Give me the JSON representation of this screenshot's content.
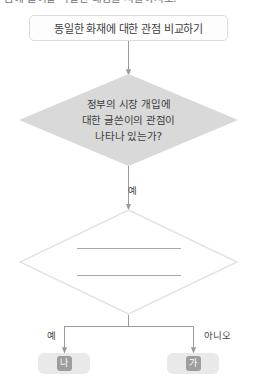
{
  "page": {
    "clipped_heading": "음에 들어갈 적절한 내용을 서술하시오.",
    "background_color": "#ffffff",
    "line_color": "#9a9a9a",
    "diamond_fill": "#d9d9d9",
    "pill_fill": "#e9e9e9",
    "chip_fill": "#9d9d9d"
  },
  "flowchart": {
    "type": "flowchart",
    "title_box": {
      "label": "동일한 화재에 대한 관점 비교하기"
    },
    "decision_1": {
      "lines": [
        "정부의 시장 개입에",
        "대한 글쓴이의 관점이",
        "나타나 있는가?"
      ]
    },
    "decision_2": {
      "lines": [
        "",
        ""
      ],
      "blank": true
    },
    "edges": [
      {
        "from": "title_box",
        "to": "decision_1",
        "label": ""
      },
      {
        "from": "decision_1",
        "to": "decision_2",
        "label": "예"
      },
      {
        "from": "decision_2",
        "to": "result_left",
        "label": "예"
      },
      {
        "from": "decision_2",
        "to": "result_right",
        "label": "아니오"
      }
    ],
    "result_left": {
      "chip": "나"
    },
    "result_right": {
      "chip": "가"
    }
  }
}
